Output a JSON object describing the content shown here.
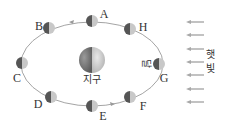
{
  "diagram": {
    "earth": {
      "label": "지구",
      "cx": 92,
      "cy": 60,
      "r": 13
    },
    "moon_label": "달",
    "sunlight_label": [
      "햇",
      "빛"
    ],
    "orbit": {
      "cx": 92,
      "cy": 64,
      "rx": 71,
      "ry": 42,
      "direction": "counterclockwise"
    },
    "moons": [
      {
        "id": "A",
        "cx": 92,
        "cy": 21,
        "lx": 104,
        "ly": 14
      },
      {
        "id": "B",
        "cx": 49,
        "cy": 28,
        "lx": 39,
        "ly": 26
      },
      {
        "id": "C",
        "cx": 22,
        "cy": 63,
        "lx": 17,
        "ly": 78
      },
      {
        "id": "D",
        "cx": 51,
        "cy": 97,
        "lx": 38,
        "ly": 104
      },
      {
        "id": "E",
        "cx": 92,
        "cy": 106,
        "lx": 103,
        "ly": 116
      },
      {
        "id": "F",
        "cx": 130,
        "cy": 97,
        "lx": 143,
        "ly": 106
      },
      {
        "id": "G",
        "cx": 159,
        "cy": 64,
        "lx": 164,
        "ly": 78
      },
      {
        "id": "H",
        "cx": 130,
        "cy": 29,
        "lx": 143,
        "ly": 27
      }
    ],
    "sun_arrows_y": [
      22,
      35,
      49,
      62,
      75,
      89,
      102
    ],
    "colors": {
      "orbit": "#9a9a9a",
      "moon_dark": "#555555",
      "moon_light": "#c8c8c8",
      "arrow": "#a8a8a8",
      "text": "#333333"
    }
  }
}
